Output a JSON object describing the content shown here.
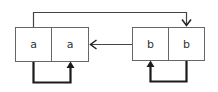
{
  "diagram": {
    "left_node": {
      "cells": [
        "a",
        "a"
      ]
    },
    "right_node": {
      "cells": [
        "b",
        "b"
      ]
    },
    "edges": [
      {
        "from": "left_node.cell0",
        "to": "right_node.cell1",
        "style": "thin",
        "route": "over-top"
      },
      {
        "from": "right_node.cell0",
        "to": "left_node",
        "style": "thin",
        "route": "straight"
      },
      {
        "from": "left_node.cell0",
        "to": "left_node.cell1",
        "style": "thick",
        "route": "loop-below"
      },
      {
        "from": "right_node.cell1",
        "to": "right_node.cell0",
        "style": "thick",
        "route": "loop-below"
      }
    ],
    "colors": {
      "box_border": "#555555",
      "thin_edge": "#444444",
      "thick_edge": "#1a1a1a",
      "text": "#333333"
    }
  }
}
